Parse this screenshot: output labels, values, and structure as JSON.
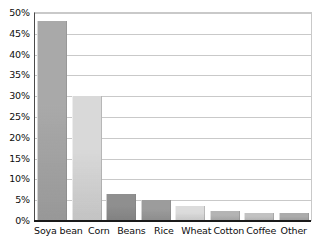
{
  "chart_data": {
    "type": "bar",
    "title": "",
    "subtitle": "",
    "xlabel": "",
    "ylabel": "",
    "categories": [
      "Soya bean",
      "Corn",
      "Beans",
      "Rice",
      "Wheat",
      "Cotton",
      "Coffee",
      "Other"
    ],
    "values": [
      48,
      30,
      6.5,
      5,
      3.5,
      2.5,
      2,
      2
    ],
    "ylim": [
      0,
      50
    ],
    "ytick_labels": [
      "0%",
      "5%",
      "10%",
      "15%",
      "20%",
      "25%",
      "30%",
      "35%",
      "40%",
      "45%",
      "50%"
    ],
    "ytick_values": [
      0,
      5,
      10,
      15,
      20,
      25,
      30,
      35,
      40,
      45,
      50
    ],
    "grid": "horizontal",
    "legend": "none",
    "bar_colors": [
      "#a9a9a9",
      "#d9d9d9",
      "#8f8f8f",
      "#9c9c9c",
      "#dcdcdc",
      "#b4b4b4",
      "#c2c2c2",
      "#ababab"
    ],
    "axis_color": "#1a1a1a",
    "gridline_color": "#c9c9c9",
    "background_color": "#ffffff",
    "annotations": []
  }
}
